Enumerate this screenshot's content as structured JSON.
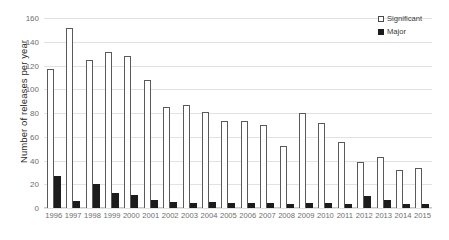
{
  "chart_data": {
    "type": "bar",
    "title": "",
    "xlabel": "",
    "ylabel": "Number of releases per year",
    "ylim": [
      0,
      160
    ],
    "yticks": [
      0,
      20,
      40,
      60,
      80,
      100,
      120,
      140,
      160
    ],
    "grid": true,
    "legend_position": "top-right",
    "categories": [
      "1996",
      "1997",
      "1998",
      "1999",
      "2000",
      "2001",
      "2002",
      "2003",
      "2004",
      "2005",
      "2006",
      "2007",
      "2008",
      "2009",
      "2010",
      "2011",
      "2012",
      "2013",
      "2014",
      "2015"
    ],
    "series": [
      {
        "name": "Significant",
        "color": "#ffffff",
        "values": [
          117,
          152,
          125,
          131,
          128,
          108,
          85,
          87,
          81,
          73,
          73,
          70,
          52,
          80,
          72,
          56,
          39,
          43,
          32,
          34
        ]
      },
      {
        "name": "Major",
        "color": "#1c1c1c",
        "values": [
          27,
          6,
          20,
          13,
          11,
          7,
          5,
          4,
          5,
          4,
          4,
          4,
          3,
          4,
          4,
          3,
          10,
          7,
          3,
          3
        ]
      }
    ]
  },
  "legend": {
    "items": [
      {
        "label": "Significant",
        "swatch": "open-square-swatch"
      },
      {
        "label": "Major",
        "swatch": "filled-square-swatch"
      }
    ]
  },
  "axes": {
    "y_title": "Number of releases per year"
  }
}
